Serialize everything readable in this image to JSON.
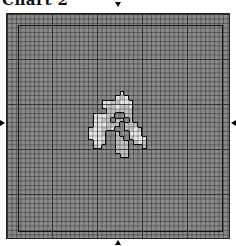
{
  "title": "Chart 2",
  "grid": {
    "cols": 50,
    "rows": 50,
    "cell_px": 4.5,
    "major_every": 10
  },
  "colors": {
    "background": "#8a8a8a",
    "light": "#e6e6e6",
    "mid": "#c2c2c2",
    "outline": "#111111"
  },
  "motif_cells": [
    [
      25,
      17,
      "light"
    ],
    [
      24,
      18,
      "light"
    ],
    [
      25,
      18,
      "mid"
    ],
    [
      26,
      18,
      "light"
    ],
    [
      21,
      19,
      "light"
    ],
    [
      22,
      19,
      "light"
    ],
    [
      23,
      19,
      "mid"
    ],
    [
      24,
      19,
      "mid"
    ],
    [
      25,
      19,
      "light"
    ],
    [
      26,
      19,
      "light"
    ],
    [
      27,
      19,
      "light"
    ],
    [
      21,
      20,
      "light"
    ],
    [
      22,
      20,
      "mid"
    ],
    [
      23,
      20,
      "mid"
    ],
    [
      24,
      20,
      "light"
    ],
    [
      25,
      20,
      "mid"
    ],
    [
      26,
      20,
      "mid"
    ],
    [
      27,
      20,
      "light"
    ],
    [
      22,
      21,
      "mid"
    ],
    [
      23,
      21,
      "mid"
    ],
    [
      24,
      21,
      "mid"
    ],
    [
      25,
      21,
      "mid"
    ],
    [
      26,
      21,
      "mid"
    ],
    [
      27,
      21,
      "mid"
    ],
    [
      19,
      22,
      "light"
    ],
    [
      20,
      22,
      "light"
    ],
    [
      21,
      22,
      "light"
    ],
    [
      22,
      22,
      "mid"
    ],
    [
      23,
      22,
      "mid"
    ],
    [
      26,
      22,
      "mid"
    ],
    [
      27,
      22,
      "mid"
    ],
    [
      19,
      23,
      "light"
    ],
    [
      20,
      23,
      "light"
    ],
    [
      21,
      23,
      "mid"
    ],
    [
      22,
      23,
      "mid"
    ],
    [
      24,
      23,
      "mid"
    ],
    [
      25,
      23,
      "mid"
    ],
    [
      27,
      23,
      "mid"
    ],
    [
      19,
      24,
      "light"
    ],
    [
      20,
      24,
      "light"
    ],
    [
      21,
      24,
      "light"
    ],
    [
      22,
      24,
      "mid"
    ],
    [
      23,
      24,
      "mid"
    ],
    [
      24,
      24,
      "mid"
    ],
    [
      26,
      24,
      "mid"
    ],
    [
      27,
      24,
      "mid"
    ],
    [
      28,
      24,
      "mid"
    ],
    [
      18,
      25,
      "mid"
    ],
    [
      19,
      25,
      "light"
    ],
    [
      20,
      25,
      "light"
    ],
    [
      21,
      25,
      "mid"
    ],
    [
      22,
      25,
      "mid"
    ],
    [
      23,
      25,
      "light"
    ],
    [
      26,
      25,
      "mid"
    ],
    [
      27,
      25,
      "mid"
    ],
    [
      28,
      25,
      "light"
    ],
    [
      29,
      25,
      "mid"
    ],
    [
      18,
      26,
      "light"
    ],
    [
      19,
      26,
      "light"
    ],
    [
      20,
      26,
      "light"
    ],
    [
      21,
      26,
      "mid"
    ],
    [
      24,
      26,
      "mid"
    ],
    [
      27,
      26,
      "light"
    ],
    [
      28,
      26,
      "light"
    ],
    [
      29,
      26,
      "light"
    ],
    [
      18,
      27,
      "light"
    ],
    [
      19,
      27,
      "light"
    ],
    [
      20,
      27,
      "light"
    ],
    [
      21,
      27,
      "light"
    ],
    [
      24,
      27,
      "mid"
    ],
    [
      25,
      27,
      "mid"
    ],
    [
      27,
      27,
      "mid"
    ],
    [
      28,
      27,
      "light"
    ],
    [
      29,
      27,
      "light"
    ],
    [
      30,
      27,
      "light"
    ],
    [
      19,
      28,
      "light"
    ],
    [
      20,
      28,
      "light"
    ],
    [
      21,
      28,
      "mid"
    ],
    [
      24,
      28,
      "mid"
    ],
    [
      25,
      28,
      "mid"
    ],
    [
      26,
      28,
      "mid"
    ],
    [
      28,
      28,
      "mid"
    ],
    [
      29,
      28,
      "light"
    ],
    [
      30,
      28,
      "mid"
    ],
    [
      19,
      29,
      "mid"
    ],
    [
      20,
      29,
      "light"
    ],
    [
      24,
      29,
      "mid"
    ],
    [
      25,
      29,
      "mid"
    ],
    [
      26,
      29,
      "mid"
    ],
    [
      30,
      29,
      "mid"
    ],
    [
      24,
      30,
      "mid"
    ],
    [
      25,
      30,
      "mid"
    ],
    [
      26,
      30,
      "mid"
    ],
    [
      25,
      31,
      "mid"
    ],
    [
      26,
      31,
      "mid"
    ]
  ],
  "markers": [
    "top-center-arrow",
    "bottom-center-arrow",
    "left-center-arrow",
    "right-center-arrow"
  ]
}
